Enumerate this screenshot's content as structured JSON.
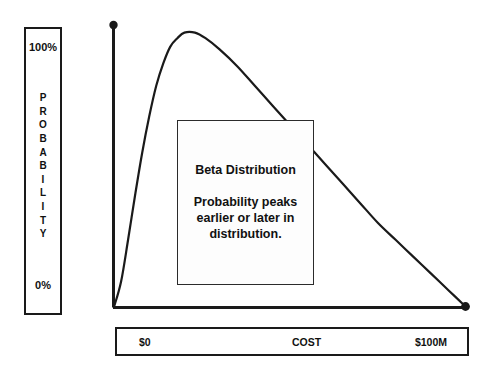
{
  "chart_data": {
    "type": "line",
    "title": "",
    "xlabel": "COST",
    "ylabel": "PROBABILITY",
    "xlim": [
      0,
      100
    ],
    "ylim": [
      0,
      100
    ],
    "xtick_labels": [
      "$0",
      "$100M"
    ],
    "ytick_labels": [
      "0%",
      "100%"
    ],
    "grid": false,
    "legend": null,
    "distribution": "Beta Distribution",
    "x": [
      0,
      2,
      4,
      6,
      8,
      10,
      12,
      14,
      16,
      18,
      20,
      23,
      26,
      30,
      35,
      40,
      45,
      50,
      55,
      60,
      65,
      70,
      75,
      80,
      85,
      90,
      95,
      100
    ],
    "y": [
      0,
      9,
      24,
      40,
      55,
      68,
      79,
      87,
      93,
      96,
      98,
      98,
      96,
      92,
      86,
      79,
      72,
      65,
      58,
      51,
      44,
      37,
      30,
      24,
      18,
      12,
      6,
      0
    ],
    "peak_x": 23,
    "peak_y": 98,
    "endpoint_markers": [
      {
        "name": "y-axis-top-marker",
        "x": 0,
        "y": 100
      },
      {
        "name": "curve-end-marker",
        "x": 100,
        "y": 0
      }
    ]
  },
  "axes": {
    "y_box": {
      "top_label": "100%",
      "bottom_label": "0%",
      "vertical_label": "PROBABILITY",
      "vertical_letters": [
        "P",
        "R",
        "O",
        "B",
        "A",
        "B",
        "I",
        "L",
        "I",
        "T",
        "Y"
      ]
    },
    "x_box": {
      "min_label": "$0",
      "name_label": "COST",
      "max_label": "$100M"
    }
  },
  "callout": {
    "title": "Beta Distribution",
    "body": "Probability peaks earlier or later in distribution."
  },
  "colors": {
    "background": "#ffffff",
    "line": "#1a1a1a",
    "axis": "#1a1a1a",
    "text": "#111111",
    "callout_border": "#2b2b2b",
    "callout_fill": "#fdfdfd"
  }
}
